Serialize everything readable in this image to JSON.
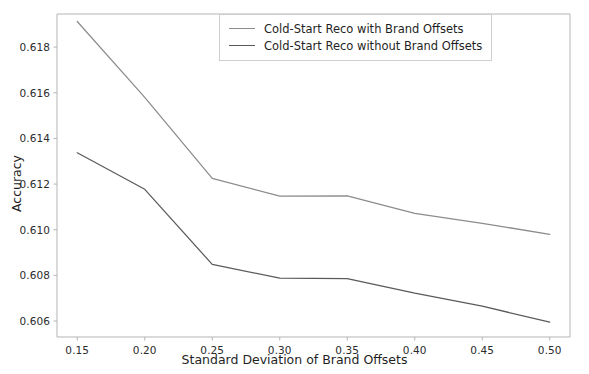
{
  "chart_data": {
    "type": "line",
    "title": "",
    "xlabel": "Standard Deviation of Brand Offsets",
    "ylabel": "Accuracy",
    "x": [
      0.15,
      0.2,
      0.25,
      0.3,
      0.35,
      0.4,
      0.45,
      0.5
    ],
    "xlim": [
      0.135,
      0.515
    ],
    "ylim": [
      0.6053,
      0.61945
    ],
    "xticks": [
      "0.15",
      "0.20",
      "0.25",
      "0.30",
      "0.35",
      "0.40",
      "0.45",
      "0.50"
    ],
    "xtick_values": [
      0.15,
      0.2,
      0.25,
      0.3,
      0.35,
      0.4,
      0.45,
      0.5
    ],
    "yticks": [
      "0.606",
      "0.608",
      "0.610",
      "0.612",
      "0.614",
      "0.616",
      "0.618"
    ],
    "ytick_values": [
      0.606,
      0.608,
      0.61,
      0.612,
      0.614,
      0.616,
      0.618
    ],
    "grid": false,
    "legend_position": "upper right",
    "series": [
      {
        "name": "Cold-Start Reco with Brand Offsets",
        "color": "#8c8c8c",
        "values": [
          0.61912,
          0.6158,
          0.61225,
          0.61147,
          0.61148,
          0.61072,
          0.61028,
          0.6098
        ]
      },
      {
        "name": "Cold-Start Reco without Brand Offsets",
        "color": "#5a5a5a",
        "values": [
          0.61337,
          0.61177,
          0.60848,
          0.60788,
          0.60786,
          0.60722,
          0.60665,
          0.60595
        ]
      }
    ]
  },
  "axes": {
    "spine_color": "#b5b5b5",
    "tick_color": "#b5b5b5",
    "background": "#ffffff"
  }
}
